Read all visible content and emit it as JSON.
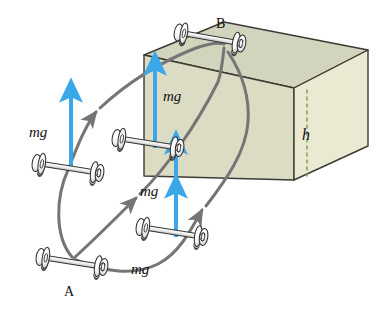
{
  "figure": {
    "background_color": "#ffffff"
  },
  "box": {
    "name": "rectangular-block",
    "front_face_color": "#dcdcc4",
    "top_face_color": "#d2d4bd",
    "right_face_color": "#eaead2",
    "edge_color": "#3b3b33",
    "height_label": "h",
    "height_dash_color": "#8f9a5a"
  },
  "points": {
    "start_label": "A",
    "end_label": "B"
  },
  "weight_arrows": {
    "color": "#3aa8e8",
    "label": "mg",
    "items": [
      {
        "id": "mg-left",
        "label": "mg"
      },
      {
        "id": "mg-upper-front",
        "label": "mg"
      },
      {
        "id": "mg-lower-front",
        "label": "mg"
      },
      {
        "id": "mg-bottom",
        "label": "mg"
      }
    ]
  },
  "paths": {
    "color": "#757575",
    "count": 3,
    "descriptions": [
      "left outer path from A up and over to B",
      "middle straight diagonal path from A across the block face to B",
      "right path from A curving right and looping up to B"
    ]
  },
  "dumbbells": {
    "bar_color": "#f2f2f2",
    "plate_color": "#ffffff",
    "outline_color": "#2b2b2b",
    "items": [
      {
        "id": "dumbbell-B",
        "position_label": "B"
      },
      {
        "id": "dumbbell-left-middle",
        "position_label": ""
      },
      {
        "id": "dumbbell-box-face",
        "position_label": ""
      },
      {
        "id": "dumbbell-lower-middle",
        "position_label": ""
      },
      {
        "id": "dumbbell-A",
        "position_label": "A"
      }
    ]
  }
}
